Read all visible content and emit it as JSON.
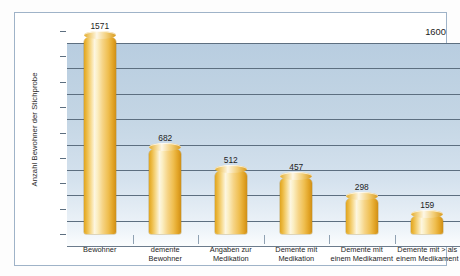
{
  "chart_data": {
    "type": "bar",
    "title": "",
    "xlabel": "",
    "ylabel": "Anzahl Bewohner der Stichprobe",
    "ylim": [
      0,
      1600
    ],
    "yticks": [
      0,
      200,
      400,
      600,
      800,
      1000,
      1200,
      1400,
      1600
    ],
    "ytick_labels": [
      "0",
      "200",
      "400",
      "600",
      "800",
      "1000",
      "1200",
      "1400",
      "1600"
    ],
    "grid": true,
    "legend": "none",
    "categories": [
      "Bewohner",
      "demente Bewohner",
      "Angaben zur Medikation",
      "Demente mit Medikation",
      "Demente mit einem Medikament",
      "Demente mit > als einem Medikament"
    ],
    "category_lines": [
      [
        "Bewohner"
      ],
      [
        "demente",
        "Bewohner"
      ],
      [
        "Angaben zur",
        "Medikation"
      ],
      [
        "Demente mit",
        "Medikation"
      ],
      [
        "Demente mit",
        "einem Medikament"
      ],
      [
        "Demente mit > als",
        "einem Medikament"
      ]
    ],
    "values": [
      1571,
      682,
      512,
      457,
      298,
      159
    ],
    "value_labels": [
      "1571",
      "682",
      "512",
      "457",
      "298",
      "159"
    ],
    "colors": {
      "bar_gold_dark": "#cf8f18",
      "bar_gold_mid": "#efbe4f",
      "bar_highlight": "#fdf6e0",
      "plot_bg_top": "#b8cde0",
      "plot_bg_bottom": "#fbfdfe",
      "gridline": "#5d6f80",
      "frame": "#9fb3c8",
      "text": "#1d1d1d"
    }
  }
}
